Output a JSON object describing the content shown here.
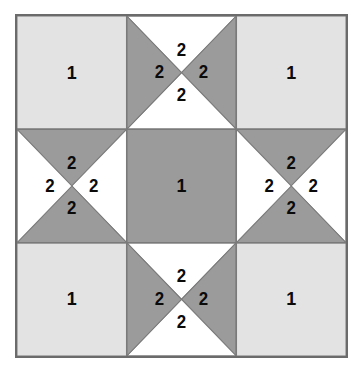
{
  "figure": {
    "name": "quilt-block-diagram",
    "background_color": "#ffffff"
  },
  "block": {
    "border_color": "#6b6b6b",
    "border_width": 2,
    "grid_rows": 3,
    "grid_cols": 3,
    "cell_size": 110.3
  },
  "colors": {
    "light": "#e3e3e3",
    "dark": "#9b9b9b",
    "white": "#ffffff",
    "outline": "#6b6b6b",
    "seam_line": "#7a7a7a",
    "label_text": "#0a0a0a"
  },
  "legend": {
    "patch_1": "1",
    "patch_2": "2"
  },
  "cells": [
    {
      "id": "cell-top-left",
      "name": "corner-square-top-left",
      "row": 0,
      "col": 0,
      "type": "square",
      "fill": "light",
      "label": "1"
    },
    {
      "id": "cell-top-center",
      "name": "hourglass-unit-top-center",
      "row": 0,
      "col": 1,
      "type": "hourglass",
      "orientation": "dark-left-right",
      "triangles": [
        {
          "position": "top",
          "fill": "white",
          "label": "2"
        },
        {
          "position": "right",
          "fill": "dark",
          "label": "2"
        },
        {
          "position": "bottom",
          "fill": "white",
          "label": "2"
        },
        {
          "position": "left",
          "fill": "dark",
          "label": "2"
        }
      ]
    },
    {
      "id": "cell-top-right",
      "name": "corner-square-top-right",
      "row": 0,
      "col": 2,
      "type": "square",
      "fill": "light",
      "label": "1"
    },
    {
      "id": "cell-middle-left",
      "name": "hourglass-unit-middle-left",
      "row": 1,
      "col": 0,
      "type": "hourglass",
      "orientation": "dark-top-bottom",
      "triangles": [
        {
          "position": "top",
          "fill": "dark",
          "label": "2"
        },
        {
          "position": "right",
          "fill": "white",
          "label": "2"
        },
        {
          "position": "bottom",
          "fill": "dark",
          "label": "2"
        },
        {
          "position": "left",
          "fill": "white",
          "label": "2"
        }
      ]
    },
    {
      "id": "cell-center",
      "name": "center-square",
      "row": 1,
      "col": 1,
      "type": "square",
      "fill": "dark",
      "label": "1"
    },
    {
      "id": "cell-middle-right",
      "name": "hourglass-unit-middle-right",
      "row": 1,
      "col": 2,
      "type": "hourglass",
      "orientation": "dark-top-bottom",
      "triangles": [
        {
          "position": "top",
          "fill": "dark",
          "label": "2"
        },
        {
          "position": "right",
          "fill": "white",
          "label": "2"
        },
        {
          "position": "bottom",
          "fill": "dark",
          "label": "2"
        },
        {
          "position": "left",
          "fill": "white",
          "label": "2"
        }
      ]
    },
    {
      "id": "cell-bottom-left",
      "name": "corner-square-bottom-left",
      "row": 2,
      "col": 0,
      "type": "square",
      "fill": "light",
      "label": "1"
    },
    {
      "id": "cell-bottom-center",
      "name": "hourglass-unit-bottom-center",
      "row": 2,
      "col": 1,
      "type": "hourglass",
      "orientation": "dark-left-right",
      "triangles": [
        {
          "position": "top",
          "fill": "white",
          "label": "2"
        },
        {
          "position": "right",
          "fill": "dark",
          "label": "2"
        },
        {
          "position": "bottom",
          "fill": "white",
          "label": "2"
        },
        {
          "position": "left",
          "fill": "dark",
          "label": "2"
        }
      ]
    },
    {
      "id": "cell-bottom-right",
      "name": "corner-square-bottom-right",
      "row": 2,
      "col": 2,
      "type": "square",
      "fill": "light",
      "label": "1"
    }
  ]
}
